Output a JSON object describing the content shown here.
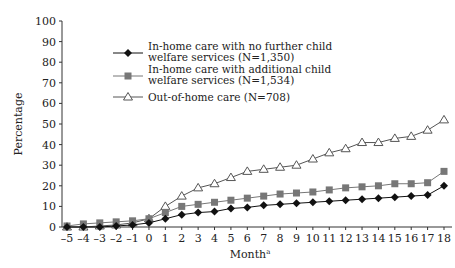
{
  "chart_data": {
    "type": "line",
    "title": "",
    "xlabel": "Month",
    "xlabel_superscript": "a",
    "ylabel": "Percentage",
    "ylim": [
      0,
      100
    ],
    "yticks": [
      0,
      10,
      20,
      30,
      40,
      50,
      60,
      70,
      80,
      90,
      100
    ],
    "x": [
      -5,
      -4,
      -3,
      -2,
      -1,
      0,
      1,
      2,
      3,
      4,
      5,
      6,
      7,
      8,
      9,
      10,
      11,
      12,
      13,
      14,
      15,
      16,
      17,
      18
    ],
    "grid": false,
    "legend_position": "upper-left-inside",
    "series": [
      {
        "name": "In-home care with no further child welfare services (N=1,350)",
        "legend_lines": [
          "In-home care with no further child",
          "welfare services  (N=1,350)"
        ],
        "marker": "diamond",
        "color": "#111111",
        "values": [
          0,
          0,
          0,
          0.5,
          1,
          2,
          4,
          6,
          7,
          7.5,
          9,
          9.5,
          10.5,
          11,
          11.5,
          12,
          12.5,
          13,
          13.5,
          14,
          14.5,
          15,
          15.5,
          20
        ]
      },
      {
        "name": "In-home care with additional child welfare services (N=1,534)",
        "legend_lines": [
          "In-home care with additional child",
          "welfare services (N=1,534)"
        ],
        "marker": "square",
        "color": "#777777",
        "values": [
          0.5,
          1.5,
          2,
          2.5,
          3,
          4,
          7,
          10,
          11,
          12,
          13,
          14,
          15,
          16,
          16.5,
          17,
          18,
          19,
          19.5,
          20,
          21,
          21,
          21.5,
          27
        ]
      },
      {
        "name": "Out-of-home care (N=708)",
        "legend_lines": [
          "Out-of-home care (N=708)"
        ],
        "marker": "triangle-open",
        "color": "#555555",
        "values": [
          0,
          0,
          0.5,
          1,
          2,
          4,
          10,
          15,
          19,
          21,
          24,
          27,
          28,
          29,
          30,
          33,
          36,
          38,
          41,
          41,
          43,
          44,
          47,
          52
        ]
      }
    ]
  }
}
